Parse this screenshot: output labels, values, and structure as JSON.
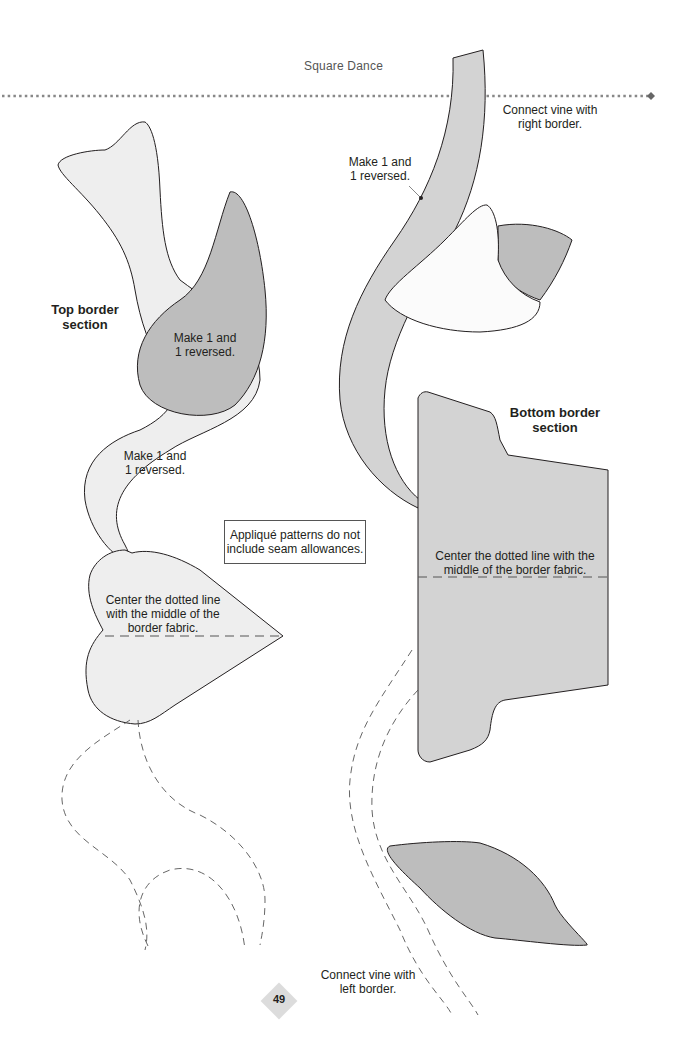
{
  "header": {
    "title": "Square Dance"
  },
  "colors": {
    "light_fill": "#eeeeee",
    "mid_fill": "#d3d3d3",
    "dark_fill": "#bdbdbd",
    "white_fill": "#fbfbfb",
    "outline": "#231f20"
  },
  "labels": {
    "top_section": [
      "Top border",
      "section"
    ],
    "bottom_section": [
      "Bottom border",
      "section"
    ],
    "make_reversed_dark": [
      "Make 1 and",
      "1 reversed."
    ],
    "make_reversed_light": [
      "Make 1 and",
      "1 reversed."
    ],
    "make_reversed_vine": [
      "Make 1 and",
      "1 reversed."
    ],
    "connect_right": [
      "Connect vine with",
      "right border."
    ],
    "connect_left": [
      "Connect vine with",
      "left border."
    ],
    "center_left": [
      "Center the dotted line",
      "with the  middle of the",
      "border fabric."
    ],
    "center_right": [
      "Center the dotted line with the",
      "middle of the border fabric."
    ],
    "note": [
      "Appliqué patterns do not",
      "include seam allowances."
    ]
  },
  "footer": {
    "page_number": "49"
  }
}
